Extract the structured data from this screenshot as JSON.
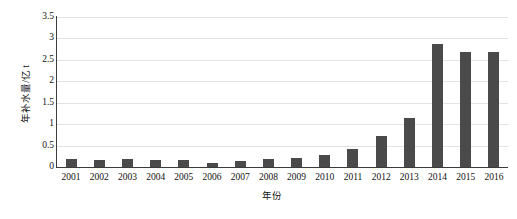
{
  "chart_data": {
    "type": "bar",
    "title": "",
    "xlabel": "年份",
    "ylabel": "年补水量/亿 t",
    "categories": [
      "2001",
      "2002",
      "2003",
      "2004",
      "2005",
      "2006",
      "2007",
      "2008",
      "2009",
      "2010",
      "2011",
      "2012",
      "2013",
      "2014",
      "2015",
      "2016"
    ],
    "values": [
      0.18,
      0.17,
      0.18,
      0.17,
      0.17,
      0.1,
      0.15,
      0.19,
      0.22,
      0.28,
      0.42,
      0.73,
      1.15,
      2.88,
      2.68,
      2.68
    ],
    "series": [
      {
        "name": "年补水量",
        "values": [
          0.18,
          0.17,
          0.18,
          0.17,
          0.17,
          0.1,
          0.15,
          0.19,
          0.22,
          0.28,
          0.42,
          0.73,
          1.15,
          2.88,
          2.68,
          2.68
        ]
      }
    ],
    "ylim": [
      0,
      3.5
    ],
    "yticks": [
      0,
      0.5,
      1,
      1.5,
      2,
      2.5,
      3,
      3.5
    ],
    "ytick_labels": [
      "0",
      "0.5",
      "1",
      "1.5",
      "2",
      "2.5",
      "3",
      "3.5"
    ],
    "grid": true,
    "legend": false,
    "legend_position": "none",
    "bar_color": "#4a4a4a",
    "grid_color": "#e3e3e3",
    "axis_color": "#3b3b3b",
    "background": "#ffffff"
  }
}
